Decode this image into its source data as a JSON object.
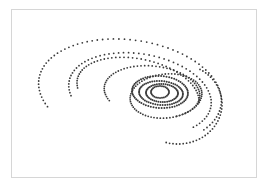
{
  "chart_data": {
    "type": "scatter",
    "title": "",
    "xlabel": "",
    "ylabel": "",
    "grid": false,
    "legend": null,
    "dot_color": "#3a3a3a",
    "frame_color": "#d6d6d6",
    "center": [
      160,
      92
    ],
    "series": [
      {
        "name": "orbit-1",
        "cx": 130,
        "cy": 92,
        "rx": 92,
        "ry": 52,
        "rot": 8,
        "start": 150,
        "end": 395,
        "n": 70,
        "r": 0.9
      },
      {
        "name": "orbit-2",
        "cx": 140,
        "cy": 94,
        "rx": 72,
        "ry": 40,
        "rot": 10,
        "start": 160,
        "end": 400,
        "n": 58,
        "r": 0.9
      },
      {
        "name": "orbit-3",
        "cx": 138,
        "cy": 92,
        "rx": 62,
        "ry": 33,
        "rot": 12,
        "start": 165,
        "end": 360,
        "n": 48,
        "r": 0.9
      },
      {
        "name": "orbit-4",
        "cx": 152,
        "cy": 92,
        "rx": 48,
        "ry": 26,
        "rot": 6,
        "start": 150,
        "end": 420,
        "n": 60,
        "r": 0.9
      },
      {
        "name": "orbit-5",
        "cx": 160,
        "cy": 92,
        "rx": 28,
        "ry": 16,
        "rot": 4,
        "start": 0,
        "end": 360,
        "n": 64,
        "r": 1.0
      },
      {
        "name": "orbit-6",
        "cx": 161,
        "cy": 93,
        "rx": 22,
        "ry": 12,
        "rot": 4,
        "start": 0,
        "end": 360,
        "n": 56,
        "r": 1.0
      },
      {
        "name": "orbit-7",
        "cx": 162,
        "cy": 93,
        "rx": 16,
        "ry": 9,
        "rot": 2,
        "start": 0,
        "end": 360,
        "n": 46,
        "r": 1.0
      },
      {
        "name": "orbit-8",
        "cx": 160,
        "cy": 92,
        "rx": 9,
        "ry": 6,
        "rot": 0,
        "start": 0,
        "end": 360,
        "n": 28,
        "r": 1.0
      },
      {
        "name": "orbit-9",
        "cx": 166,
        "cy": 96,
        "rx": 36,
        "ry": 22,
        "rot": -6,
        "start": 0,
        "end": 360,
        "n": 70,
        "r": 0.9
      },
      {
        "name": "orbit-10",
        "cx": 178,
        "cy": 104,
        "rx": 44,
        "ry": 40,
        "rot": 0,
        "start": -60,
        "end": 110,
        "n": 38,
        "r": 0.9
      }
    ]
  }
}
